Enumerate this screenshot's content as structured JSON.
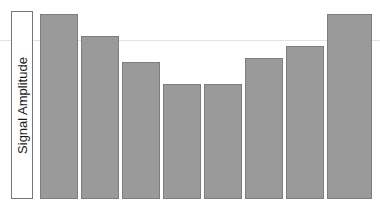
{
  "chart_data": {
    "type": "bar",
    "title": "",
    "xlabel": "",
    "ylabel": "Signal Amplitude",
    "categories": [
      "1",
      "2",
      "3",
      "4",
      "5",
      "6",
      "7",
      "8"
    ],
    "values": [
      100,
      88,
      74,
      61,
      61,
      76,
      82,
      100
    ],
    "ylim": [
      0,
      100
    ],
    "xlim": [
      0,
      8
    ],
    "grid": true,
    "gridlines_y": [
      86
    ],
    "legend": null,
    "legend_position": "none",
    "tick_labels_x": [],
    "tick_labels_y": [],
    "annotations": [],
    "bar_fill_color": "#9a9a9a",
    "bar_edge_color": "#7e7e7e",
    "gridline_color": "#e2e2e2",
    "background_color": "#ffffff",
    "bars": [
      {
        "name": "bar-1",
        "value": 100,
        "left_px": 40,
        "width_px": 38,
        "top_px": 14,
        "height_px": 185
      },
      {
        "name": "bar-2",
        "value": 88,
        "left_px": 81,
        "width_px": 38,
        "top_px": 36,
        "height_px": 163
      },
      {
        "name": "bar-3",
        "value": 74,
        "left_px": 122,
        "width_px": 38,
        "top_px": 62,
        "height_px": 137
      },
      {
        "name": "bar-4",
        "value": 61,
        "left_px": 163,
        "width_px": 38,
        "top_px": 84,
        "height_px": 115
      },
      {
        "name": "bar-5",
        "value": 61,
        "left_px": 204,
        "width_px": 38,
        "top_px": 84,
        "height_px": 115
      },
      {
        "name": "bar-6",
        "value": 76,
        "left_px": 245,
        "width_px": 38,
        "top_px": 58,
        "height_px": 141
      },
      {
        "name": "bar-7",
        "value": 82,
        "left_px": 286,
        "width_px": 38,
        "top_px": 46,
        "height_px": 153
      },
      {
        "name": "bar-8",
        "value": 100,
        "left_px": 327,
        "width_px": 45,
        "top_px": 14,
        "height_px": 185
      }
    ],
    "gridline_y_px": 40,
    "baseline_y_px": 199
  },
  "axis": {
    "ylabel_text": "Signal Amplitude"
  }
}
